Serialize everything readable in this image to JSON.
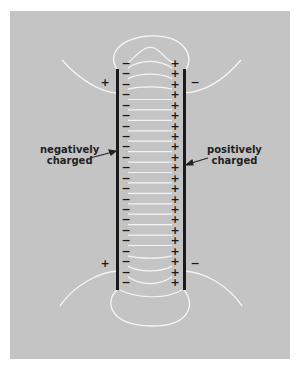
{
  "labels": {
    "left_plate": [
      "negatively",
      "charged"
    ],
    "right_plate": [
      "positively",
      "charged"
    ]
  },
  "charges": {
    "left_plate_symbol": "−",
    "right_plate_symbol": "+",
    "count_per_plate": 22,
    "outer_top_left": "+",
    "outer_top_right": "−",
    "outer_bottom_left": "+",
    "outer_bottom_right": "−"
  },
  "colors": {
    "background": "#c4c4c4",
    "plate": "#1a1a1a",
    "field_line": "#f4f4f4"
  }
}
